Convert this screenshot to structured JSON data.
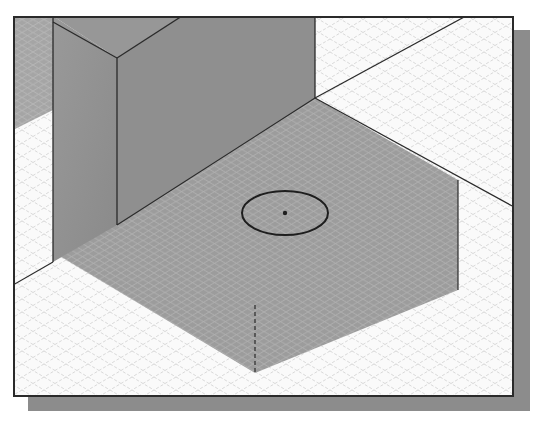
{
  "scene": {
    "type": "isometric-3d-model-viewport",
    "description": "Shaded isometric CAD model: tall rectangular block on a square base slab with a circular sketch on the top face",
    "colors": {
      "background": "#ffffff",
      "viewport_fill": "#fafafa",
      "grid_light": "#c9c9c9",
      "model_face_left": "#8e8e8e",
      "model_face_right": "#9a9a9a",
      "model_face_top": "#a3a3a3",
      "edge": "#2a2a2a",
      "shadow": "#8c8c8c"
    },
    "sketch": {
      "shape": "circle",
      "center_marker": "point"
    },
    "hidden_edge": "dashed-vertical-line"
  }
}
